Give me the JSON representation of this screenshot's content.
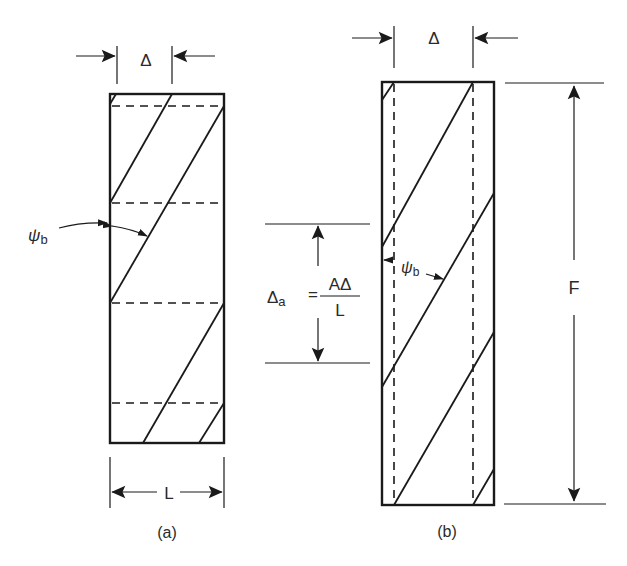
{
  "figure": {
    "panel_a": {
      "caption": "(a)",
      "top_dimension_label": "Δ",
      "bottom_dimension_label": "L",
      "angle_label": "ψ",
      "angle_label_sub": "b"
    },
    "panel_b": {
      "caption": "(b)",
      "top_dimension_label": "Δ",
      "height_label": "F",
      "angle_label": "ψ",
      "angle_label_sub": "b",
      "equation": {
        "lhs": "Δ",
        "lhs_sub": "a",
        "equals": "=",
        "numerator": "AΔ",
        "denominator": "L"
      }
    }
  }
}
